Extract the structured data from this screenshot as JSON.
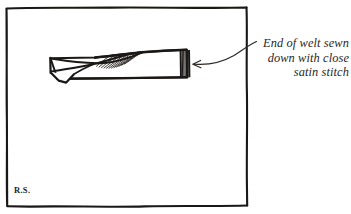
{
  "figure": {
    "title": "End of welt sewn down with close satin stitch",
    "medium": "pen-and-ink line drawing",
    "background_color": "#ffffff",
    "ink_color": "#1a1816",
    "frame": {
      "name": "hand-drawn-rectangular-border",
      "style": "irregular freehand rectangle",
      "stroke_color": "#1a1816"
    },
    "subject": {
      "name": "welt-strip",
      "description": "long horizontal fabric welt with folded-back corner at left end and satin-stitched end at right",
      "parts": [
        {
          "name": "welt-body",
          "label": "welt strip"
        },
        {
          "name": "folded-flap",
          "label": "turned-back fold at left end"
        },
        {
          "name": "fold-hatching",
          "label": "shading hatch lines on fold"
        },
        {
          "name": "satin-stitch-block",
          "label": "close satin stitch at right end"
        }
      ]
    },
    "annotation": {
      "name": "callout-label",
      "lines": [
        "End of welt sewn",
        "down with close",
        "satin stitch"
      ],
      "align": "right",
      "style": "italic serif",
      "pointer": {
        "name": "curved-arrow",
        "label": "curved leader arrow pointing left to the satin stitch end"
      }
    },
    "signature": {
      "name": "artist-initials",
      "text": "R.S."
    }
  }
}
